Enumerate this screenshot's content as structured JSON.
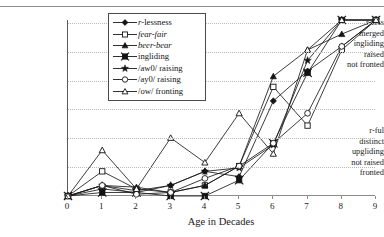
{
  "figure": {
    "title_cut_off": "",
    "background": "#ffffff",
    "line_color": "#1a1a1a",
    "grid_color": "#b9b9b9"
  },
  "axes": {
    "y_top_labels": [
      "r-less",
      "merged",
      "ingliding",
      "raised",
      "not fronted"
    ],
    "y_bottom_labels": [
      "r-ful",
      "distinct",
      "upgliding",
      "not raised",
      "fronted"
    ],
    "x_title": "Age in Decades",
    "x_ticks": [
      "0",
      "1",
      "2",
      "3",
      "4",
      "5",
      "6",
      "7",
      "8",
      "9"
    ]
  },
  "legend": {
    "items": [
      {
        "label": "r-lessness",
        "marker": "filled-diamond",
        "italic_prefix": "r"
      },
      {
        "label": "fear-fair",
        "marker": "open-square",
        "italic": true
      },
      {
        "label": "beer-bear",
        "marker": "filled-triangle",
        "italic": true
      },
      {
        "label": "ingliding",
        "marker": "filled-x-square"
      },
      {
        "label": "/aw0/ raising",
        "marker": "filled-star"
      },
      {
        "label": "/ay0/ raising",
        "marker": "open-circle"
      },
      {
        "label": "/ow/ fronting",
        "marker": "open-triangle"
      }
    ]
  },
  "chart_data": {
    "type": "line",
    "title": "",
    "xlabel": "Age in Decades",
    "ylabel": "",
    "x": [
      0,
      1,
      2,
      3,
      4,
      5,
      6,
      7,
      8,
      9
    ],
    "xlim": [
      0,
      9
    ],
    "ylim": [
      0,
      1
    ],
    "grid": true,
    "legend_position": "top-center-inside",
    "y_axis_top_meaning": [
      "r-less",
      "merged",
      "ingliding",
      "raised",
      "not fronted"
    ],
    "y_axis_bottom_meaning": [
      "r-ful",
      "distinct",
      "upgliding",
      "not raised",
      "fronted"
    ],
    "series": [
      {
        "name": "r-lessness",
        "marker": "filled-diamond",
        "values": [
          0.0,
          0.04,
          0.02,
          0.06,
          0.14,
          0.11,
          0.54,
          0.71,
          0.85,
          1.0
        ]
      },
      {
        "name": "fear-fair",
        "marker": "open-square",
        "values": [
          0.0,
          0.14,
          0.04,
          0.02,
          0.06,
          0.17,
          0.62,
          0.4,
          0.83,
          1.0
        ]
      },
      {
        "name": "beer-bear",
        "marker": "filled-triangle",
        "values": [
          0.0,
          0.06,
          0.05,
          0.02,
          0.06,
          0.17,
          0.68,
          0.83,
          0.92,
          1.0
        ]
      },
      {
        "name": "ingliding",
        "marker": "filled-x-square",
        "values": [
          0.0,
          0.02,
          0.02,
          0.0,
          0.0,
          0.09,
          0.3,
          0.7,
          1.0,
          1.0
        ]
      },
      {
        "name": "/aw0/ raising",
        "marker": "filled-star",
        "values": [
          0.0,
          0.06,
          0.03,
          0.06,
          0.14,
          0.16,
          0.29,
          0.77,
          1.0,
          1.0
        ]
      },
      {
        "name": "/ay0/ raising",
        "marker": "open-circle",
        "values": [
          0.0,
          0.06,
          0.01,
          0.02,
          0.1,
          0.17,
          0.3,
          0.47,
          0.85,
          1.0
        ]
      },
      {
        "name": "/ow/ fronting",
        "marker": "open-triangle",
        "values": [
          0.0,
          0.26,
          0.04,
          0.33,
          0.19,
          0.47,
          0.24,
          0.83,
          1.0,
          1.0
        ]
      }
    ]
  }
}
